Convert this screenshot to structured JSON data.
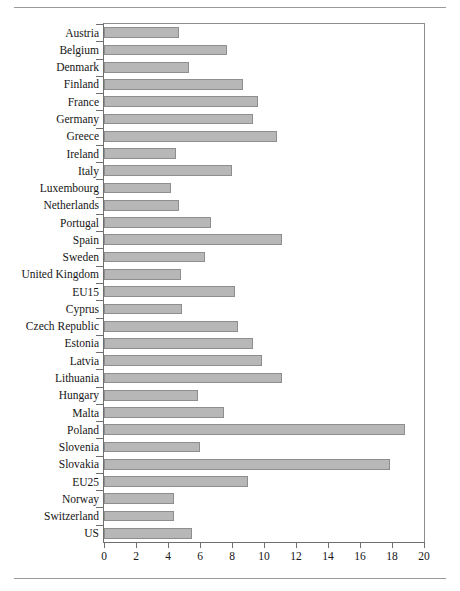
{
  "chart_data": {
    "type": "bar",
    "orientation": "horizontal",
    "title": "",
    "subtitle": "",
    "xlabel": "",
    "ylabel": "",
    "xlim": [
      0,
      20
    ],
    "ylim": null,
    "grid": false,
    "legend": null,
    "legend_position": "none",
    "xticks": [
      0,
      2,
      4,
      6,
      8,
      10,
      12,
      14,
      16,
      18,
      20
    ],
    "xtick_labels": [
      "0",
      "2",
      "4",
      "6",
      "8",
      "10",
      "12",
      "14",
      "16",
      "18",
      "20"
    ],
    "categories": [
      "Austria",
      "Belgium",
      "Denmark",
      "Finland",
      "France",
      "Germany",
      "Greece",
      "Ireland",
      "Italy",
      "Luxembourg",
      "Netherlands",
      "Portugal",
      "Spain",
      "Sweden",
      "United Kingdom",
      "EU15",
      "Cyprus",
      "Czech Republic",
      "Estonia",
      "Latvia",
      "Lithuania",
      "Hungary",
      "Malta",
      "Poland",
      "Slovenia",
      "Slovakia",
      "EU25",
      "Norway",
      "Switzerland",
      "US"
    ],
    "values": [
      4.7,
      7.7,
      5.3,
      8.7,
      9.6,
      9.3,
      10.8,
      4.5,
      8.0,
      4.2,
      4.7,
      6.7,
      11.1,
      6.3,
      4.8,
      8.2,
      4.9,
      8.4,
      9.3,
      9.9,
      11.1,
      5.9,
      7.5,
      18.8,
      6.0,
      17.9,
      9.0,
      4.4,
      4.4,
      5.5
    ],
    "bar_fill_color": "#b7b7b7",
    "bar_edge_color": "#8e8e8e",
    "axis_color": "#6f6f6f",
    "background_color": "#ffffff"
  },
  "figure": {
    "top_rule": "",
    "bottom_rule": ""
  }
}
